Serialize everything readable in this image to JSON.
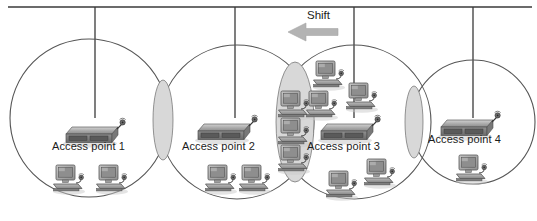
{
  "figure": {
    "background_color": "#ffffff",
    "width": 537,
    "height": 221
  },
  "annotation": {
    "shift_label": "Shift",
    "shift_direction": "left",
    "arrow_color": "#b3b3b3"
  },
  "backbone": {
    "name": "wired-backbone",
    "color": "#3a3a3a",
    "y": 7,
    "x_start": 8,
    "x_end": 532,
    "drop_color": "#3a3a3a",
    "drops": [
      {
        "x": 95,
        "y_end": 118
      },
      {
        "x": 235,
        "y_end": 118
      },
      {
        "x": 354,
        "y_end": 118
      },
      {
        "x": 473,
        "y_end": 118
      }
    ]
  },
  "colors": {
    "circle_stroke": "#555555",
    "overlap_fill": "#d8d8d8",
    "device_body": "#8e8e8e",
    "device_top": "#b8b8b8",
    "device_dark": "#4f4f4f",
    "monitor_screen": "#9b9b9b",
    "text": "#1c1c1c",
    "shadow": "#c9c9c9"
  },
  "cells": [
    {
      "id": "cell-1",
      "label": "Access point 1",
      "cx": 89,
      "cy": 118,
      "r": 79,
      "label_x": 52,
      "label_y": 140,
      "ap": {
        "x": 60,
        "y": 115
      },
      "clients": [
        {
          "x": 52,
          "y": 162
        },
        {
          "x": 95,
          "y": 162
        }
      ]
    },
    {
      "id": "cell-2",
      "label": "Access point 2",
      "cx": 237,
      "cy": 122,
      "r": 77,
      "label_x": 182,
      "label_y": 140,
      "ap": {
        "x": 192,
        "y": 112
      },
      "clients": [
        {
          "x": 204,
          "y": 162
        },
        {
          "x": 238,
          "y": 162
        }
      ]
    },
    {
      "id": "cell-3",
      "label": "Access point 3",
      "cx": 354,
      "cy": 122,
      "r": 77,
      "label_x": 307,
      "label_y": 140,
      "ap": {
        "x": 315,
        "y": 112
      },
      "clients": [
        {
          "x": 312,
          "y": 58
        },
        {
          "x": 305,
          "y": 88
        },
        {
          "x": 345,
          "y": 80
        },
        {
          "x": 325,
          "y": 168
        },
        {
          "x": 363,
          "y": 156
        }
      ]
    },
    {
      "id": "cell-4",
      "label": "Access point 4",
      "cx": 473,
      "cy": 122,
      "r": 62,
      "label_x": 428,
      "label_y": 133,
      "ap": {
        "x": 435,
        "y": 108
      },
      "clients": [
        {
          "x": 455,
          "y": 152
        }
      ]
    }
  ],
  "overlaps": [
    {
      "id": "overlap-1-2",
      "cx": 163,
      "cy": 120,
      "rx": 10,
      "ry": 40
    },
    {
      "id": "overlap-2-3",
      "cx": 295,
      "cy": 122,
      "rx": 19,
      "ry": 60
    },
    {
      "id": "overlap-3-4",
      "cx": 414,
      "cy": 122,
      "rx": 9,
      "ry": 36
    }
  ],
  "roaming_clients": {
    "id": "roaming-stack",
    "note": "clients located in overlap between cell 2 and cell 3",
    "items": [
      {
        "x": 277,
        "y": 88
      },
      {
        "x": 277,
        "y": 115
      },
      {
        "x": 277,
        "y": 142
      }
    ]
  }
}
